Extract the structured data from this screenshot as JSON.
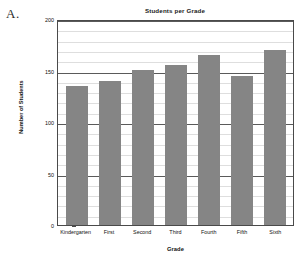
{
  "figure": {
    "label": "A."
  },
  "chart_data": {
    "type": "bar",
    "title": "Students per Grade",
    "xlabel": "Grade",
    "ylabel": "Number of Students",
    "categories": [
      "Kindergarten",
      "First",
      "Second",
      "Third",
      "Fourth",
      "Fifth",
      "Sixth"
    ],
    "values": [
      135,
      140,
      150,
      155,
      165,
      145,
      170
    ],
    "ylim": [
      0,
      200
    ],
    "yticks": [
      0,
      50,
      100,
      150,
      200
    ],
    "ytick_labels": [
      "0",
      "50",
      "100",
      "150",
      "200"
    ],
    "minor_tick_step": 10,
    "grid": true,
    "legend": null,
    "bar_color": "#858585",
    "axis_color": "#4a4a4a",
    "major_gridline_color": "#5a5a5a",
    "minor_gridline_color": "#dedede"
  }
}
